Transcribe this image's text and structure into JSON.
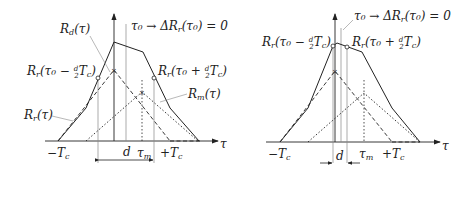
{
  "left_panel": {
    "label_Rd": "R",
    "label_Rd_sub": "d",
    "label_Rd_arg": "(τ)",
    "label_tau0": "τ₀ → ΔR",
    "label_tau0_sub": "r",
    "label_tau0_tail": "(τ₀) = 0",
    "label_minus": "R",
    "label_minus_sub": "r",
    "label_minus_tail": "(τ₀ − ",
    "label_minus_end": "T",
    "label_minus_c": "c",
    "label_minus_close": ")",
    "label_plus": "R",
    "label_plus_sub": "r",
    "label_plus_tail": "(τ₀ + ",
    "label_plus_end": "T",
    "label_plus_c": "c",
    "label_plus_close": ")",
    "label_Rm": "R",
    "label_Rm_sub": "m",
    "label_Rm_arg": "(τ)",
    "label_Rr": "R",
    "label_Rr_sub": "r",
    "label_Rr_arg": "(τ)",
    "tick_minus_Tc": "−T",
    "tick_plus_Tc": "+T",
    "tick_c": "c",
    "tick_tau_m": "τ",
    "tick_m": "m",
    "axis_tau": "τ",
    "dim_d": "d",
    "frac_num": "d",
    "frac_den": "2"
  },
  "right_panel": {
    "label_tau0": "τ₀ → ΔR",
    "label_tau0_sub": "r",
    "label_tau0_tail": "(τ₀) = 0",
    "label_minus": "R",
    "label_minus_sub": "r",
    "label_minus_tail": "(τ₀ − ",
    "label_minus_end": "T",
    "label_minus_c": "c",
    "label_minus_close": ")",
    "label_plus": "R",
    "label_plus_sub": "r",
    "label_plus_tail": "(τ₀ + ",
    "label_plus_end": "T",
    "label_plus_c": "c",
    "label_plus_close": ")",
    "tick_minus_Tc": "−T",
    "tick_plus_Tc": "+T",
    "tick_c": "c",
    "tick_tau_m": "τ",
    "tick_m": "m",
    "axis_tau": "τ",
    "dim_d": "d",
    "frac_num": "d",
    "frac_den": "2"
  },
  "colors": {
    "line": "#222222",
    "guide": "#888888"
  }
}
